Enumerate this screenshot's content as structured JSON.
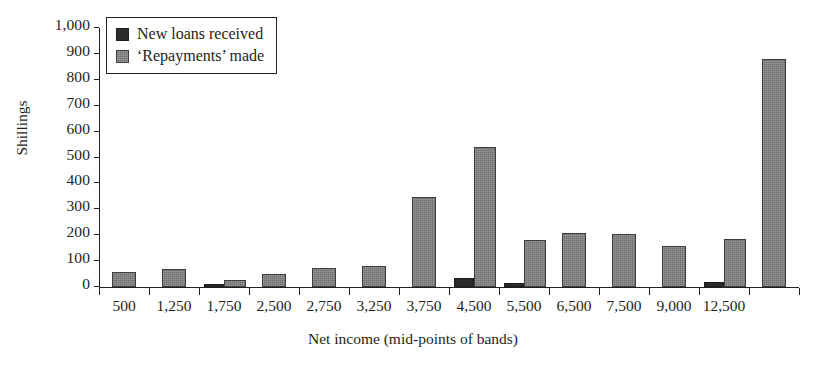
{
  "chart_data": {
    "type": "bar",
    "title": "",
    "xlabel": "Net income (mid-points of bands)",
    "ylabel": "Shillings",
    "ylim": [
      0,
      1000
    ],
    "ytick_step": 100,
    "yticks": [
      "0",
      "100",
      "200",
      "300",
      "400",
      "500",
      "600",
      "700",
      "800",
      "900",
      "1,000"
    ],
    "grid": false,
    "legend_position": "top-left",
    "categories": [
      "500",
      "1,250",
      "1,750",
      "2,500",
      "2,750",
      "3,250",
      "3,750",
      "4,500",
      "5,500",
      "6,500",
      "7,500",
      "9,000",
      "12,500",
      ""
    ],
    "series": [
      {
        "name": "New loans received",
        "color": "#2b2b2b",
        "values": [
          0,
          0,
          10,
          0,
          0,
          0,
          0,
          35,
          16,
          0,
          0,
          0,
          18,
          0
        ]
      },
      {
        "name": "'Repayments' made",
        "color": "#6e6e6e",
        "values": [
          57,
          68,
          28,
          50,
          75,
          80,
          347,
          540,
          182,
          210,
          206,
          160,
          186,
          882
        ]
      }
    ]
  },
  "legend": {
    "items": [
      {
        "label": "New loans received",
        "swatch": "dark"
      },
      {
        "label": "‘Repayments’ made",
        "swatch": "gray"
      }
    ]
  }
}
